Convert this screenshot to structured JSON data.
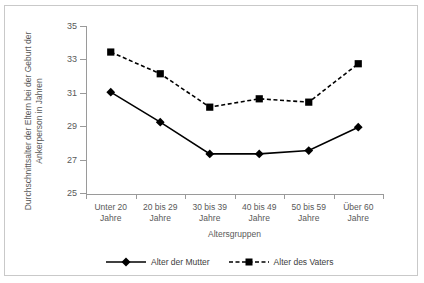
{
  "chart_data": {
    "type": "line",
    "title": "",
    "xlabel": "Altersgruppen",
    "ylabel": "Durchschnittsalter der Eltern bei der Geburt der Ankerperson in Jahren",
    "categories": [
      "Unter 20 Jahre",
      "20 bis 29 Jahre",
      "30 bis 39 Jahre",
      "40 bis 49 Jahre",
      "50 bis 59 Jahre",
      "Über 60 Jahre"
    ],
    "category_lines": [
      [
        "Unter 20",
        "Jahre"
      ],
      [
        "20 bis 29",
        "Jahre"
      ],
      [
        "30 bis 39",
        "Jahre"
      ],
      [
        "40 bis 49",
        "Jahre"
      ],
      [
        "50 bis 59",
        "Jahre"
      ],
      [
        "Über 60",
        "Jahre"
      ]
    ],
    "series": [
      {
        "name": "Alter der Mutter",
        "marker": "diamond",
        "style": "solid",
        "color": "#000000",
        "values": [
          31.1,
          29.3,
          27.4,
          27.4,
          27.6,
          29.0
        ]
      },
      {
        "name": "Alter des Vaters",
        "marker": "square",
        "style": "dashed",
        "color": "#000000",
        "values": [
          33.5,
          32.2,
          30.2,
          30.7,
          30.5,
          32.8
        ]
      }
    ],
    "ylim": [
      25,
      35
    ],
    "yticks": [
      35,
      33,
      31,
      29,
      27,
      25
    ],
    "ytick_labels": [
      "35",
      "33",
      "31",
      "29",
      "27",
      "25"
    ],
    "grid": false,
    "legend_position": "bottom",
    "axis_color": "#9a9a9a",
    "border_color": "#c9c9c9"
  }
}
